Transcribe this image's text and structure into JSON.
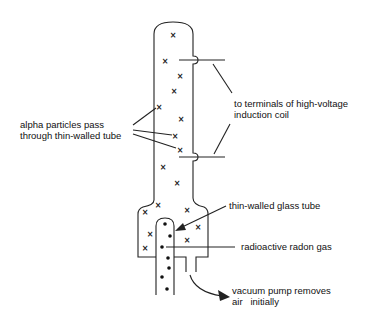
{
  "diagram": {
    "type": "apparatus",
    "labels": {
      "alpha": [
        "alpha particles pass",
        "through thin-walled tube"
      ],
      "terminals": [
        "to terminals of high-voltage",
        "induction coil"
      ],
      "glass_tube": "thin-walled glass tube",
      "radon": "radioactive radon gas",
      "pump": [
        "vacuum pump removes",
        "air   initially"
      ]
    },
    "symbols": {
      "alpha_particle": "x",
      "radon_atom": "dot"
    },
    "colors": {
      "ink": "#111111",
      "background": "#ffffff"
    }
  }
}
